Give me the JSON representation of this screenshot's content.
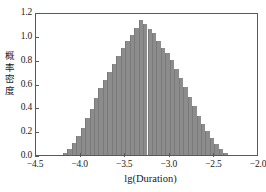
{
  "chart_data": {
    "type": "bar",
    "title": "",
    "subtitle": "",
    "xlabel": "lg(Duration)",
    "ylabel": "概率密度",
    "xlim": [
      -4.5,
      -2.0
    ],
    "ylim": [
      0.0,
      1.2
    ],
    "xticks": [
      "−4.5",
      "−4.0",
      "−3.5",
      "−3.0",
      "−2.5",
      "−2.0"
    ],
    "xtick_values": [
      -4.5,
      -4.0,
      -3.5,
      -3.0,
      -2.5,
      -2.0
    ],
    "yticks": [
      "0.0",
      "0.2",
      "0.4",
      "0.6",
      "0.8",
      "1.0",
      "1.2"
    ],
    "ytick_values": [
      0.0,
      0.2,
      0.4,
      0.6,
      0.8,
      1.0,
      1.2
    ],
    "grid": false,
    "legend": null,
    "bar_color": "#8c8c8c",
    "frame_color": "#595959",
    "bin_width": 0.05,
    "bin_centers": [
      -4.175,
      -4.125,
      -4.075,
      -4.025,
      -3.975,
      -3.925,
      -3.875,
      -3.825,
      -3.775,
      -3.725,
      -3.675,
      -3.625,
      -3.575,
      -3.525,
      -3.475,
      -3.425,
      -3.375,
      -3.325,
      -3.275,
      -3.225,
      -3.175,
      -3.125,
      -3.075,
      -3.025,
      -2.975,
      -2.925,
      -2.875,
      -2.825,
      -2.775,
      -2.725,
      -2.675,
      -2.625,
      -2.575,
      -2.525,
      -2.475,
      -2.425,
      -2.375
    ],
    "values": [
      0.02,
      0.05,
      0.1,
      0.16,
      0.23,
      0.31,
      0.39,
      0.48,
      0.56,
      0.63,
      0.7,
      0.76,
      0.83,
      0.9,
      0.96,
      1.01,
      1.07,
      1.13,
      1.1,
      1.06,
      1.02,
      0.96,
      0.9,
      0.86,
      0.8,
      0.72,
      0.65,
      0.57,
      0.49,
      0.41,
      0.33,
      0.26,
      0.2,
      0.14,
      0.09,
      0.05,
      0.02
    ]
  }
}
